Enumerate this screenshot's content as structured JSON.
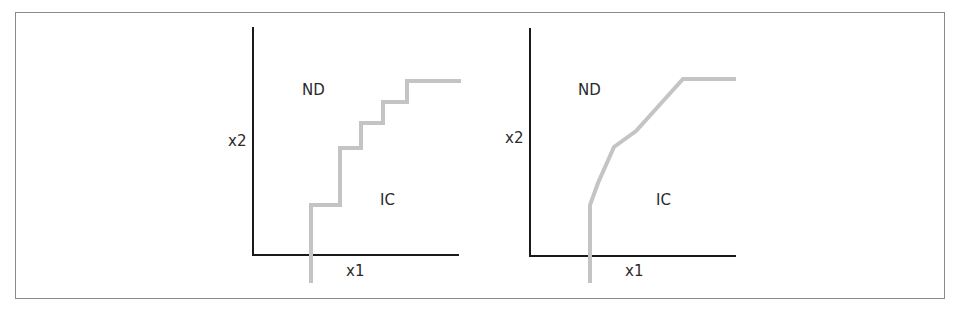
{
  "figure": {
    "panels": [
      {
        "id": "left",
        "title": "discrete indifference curve",
        "y_axis_label": "x2",
        "x_axis_label": "x1",
        "region_upper_label": "ND",
        "region_lower_label": "IC",
        "curve_style": "staircase",
        "curve_color": "#c4c4c4",
        "axis_color": "#1a1a1a"
      },
      {
        "id": "right",
        "title": "piecewise-linear indifference curve",
        "y_axis_label": "x2",
        "x_axis_label": "x1",
        "region_upper_label": "ND",
        "region_lower_label": "IC",
        "curve_style": "piecewise-linear",
        "curve_color": "#c4c4c4",
        "axis_color": "#1a1a1a"
      }
    ],
    "caption_truncated": true
  }
}
